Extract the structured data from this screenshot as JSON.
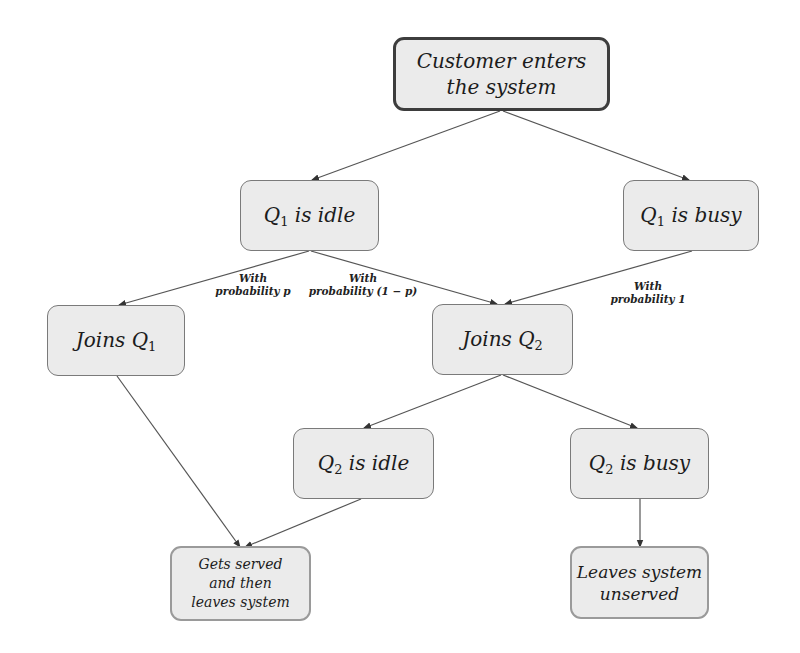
{
  "diagram": {
    "type": "flowchart",
    "colors": {
      "node_fill": "#ebebeb",
      "root_border": "#3d3d3d",
      "mid_border": "#7a7a7a",
      "leaf_border": "#9a9a9a",
      "edge": "#555555"
    },
    "nodes": {
      "enter": {
        "text": "Customer enters the system",
        "line1": "Customer enters",
        "line2": "the system"
      },
      "q1_idle": {
        "prefix": "Q",
        "sub": "1",
        "suffix": " is idle"
      },
      "q1_busy": {
        "prefix": "Q",
        "sub": "1",
        "suffix": " is busy"
      },
      "join_q1": {
        "prefix": "Joins Q",
        "sub": "1",
        "suffix": ""
      },
      "join_q2": {
        "prefix": "Joins Q",
        "sub": "2",
        "suffix": ""
      },
      "q2_idle": {
        "prefix": "Q",
        "sub": "2",
        "suffix": " is idle"
      },
      "q2_busy": {
        "prefix": "Q",
        "sub": "2",
        "suffix": " is busy"
      },
      "served": {
        "line1": "Gets served",
        "line2": "and then",
        "line3": "leaves system"
      },
      "unserved": {
        "line1": "Leaves system",
        "line2": "unserved"
      }
    },
    "edge_labels": {
      "p": {
        "line1": "With",
        "line2": "probability p"
      },
      "one_minus_p": {
        "line1": "With",
        "line2": "probability (1 − p)"
      },
      "one": {
        "line1": "With",
        "line2": "probability 1"
      }
    },
    "edges": [
      {
        "from": "enter",
        "to": "q1_idle"
      },
      {
        "from": "enter",
        "to": "q1_busy"
      },
      {
        "from": "q1_idle",
        "to": "join_q1",
        "label": "With probability p"
      },
      {
        "from": "q1_idle",
        "to": "join_q2",
        "label": "With probability (1 − p)"
      },
      {
        "from": "q1_busy",
        "to": "join_q2",
        "label": "With probability 1"
      },
      {
        "from": "join_q1",
        "to": "served"
      },
      {
        "from": "join_q2",
        "to": "q2_idle"
      },
      {
        "from": "join_q2",
        "to": "q2_busy"
      },
      {
        "from": "q2_idle",
        "to": "served"
      },
      {
        "from": "q2_busy",
        "to": "unserved"
      }
    ]
  }
}
